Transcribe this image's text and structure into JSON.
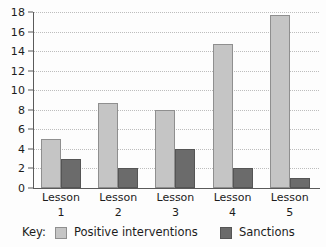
{
  "chart_data": {
    "type": "bar",
    "title": "",
    "subtitle": "",
    "xlabel": "",
    "ylabel": "",
    "categories": [
      "Lesson 1",
      "Lesson 2",
      "Lesson 3",
      "Lesson 4",
      "Lesson 5"
    ],
    "category_lines": [
      {
        "name": "Lesson",
        "number": "1"
      },
      {
        "name": "Lesson",
        "number": "2"
      },
      {
        "name": "Lesson",
        "number": "3"
      },
      {
        "name": "Lesson",
        "number": "4"
      },
      {
        "name": "Lesson",
        "number": "5"
      }
    ],
    "series": [
      {
        "name": "Positive interventions",
        "color": "#c5c5c5",
        "values": [
          5,
          8.7,
          8,
          14.7,
          17.7
        ]
      },
      {
        "name": "Sanctions",
        "color": "#6b6b6b",
        "values": [
          3,
          2,
          4,
          2,
          1
        ]
      }
    ],
    "ylim": [
      0,
      18
    ],
    "ytick_step": 2,
    "ytick_labels": [
      "0",
      "2",
      "4",
      "6",
      "8",
      "10",
      "12",
      "14",
      "16",
      "18"
    ],
    "grid": true,
    "grid_axis": "y",
    "grid_style": "dotted",
    "legend_position": "bottom-left",
    "legend_title": "Key:"
  }
}
